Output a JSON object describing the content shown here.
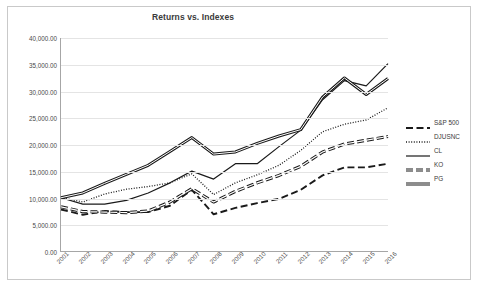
{
  "chart_data": {
    "type": "line",
    "title": "Returns vs. Indexes",
    "xlabel": "",
    "ylabel": "",
    "grid": true,
    "legend_position": "right",
    "ylim": [
      0,
      40000
    ],
    "ytick_labels": [
      "40,000.00",
      "35,000.00",
      "30,000.00",
      "25,000.00",
      "20,000.00",
      "15,000.00",
      "10,000.00",
      "5,000.00",
      "0.00"
    ],
    "ytick_values": [
      40000,
      35000,
      30000,
      25000,
      20000,
      15000,
      10000,
      5000,
      0
    ],
    "categories": [
      "2001",
      "2002",
      "2003",
      "2004",
      "2005",
      "2006",
      "2007",
      "2008",
      "2009",
      "2010",
      "2011",
      "2012",
      "2013",
      "2014",
      "2015",
      "2016"
    ],
    "series": [
      {
        "name": "S&P 500",
        "style": "long-dash",
        "values": [
          7800,
          6800,
          7500,
          7300,
          7300,
          8500,
          11500,
          6900,
          8100,
          9000,
          9800,
          11500,
          14200,
          15700,
          15700,
          16400
        ]
      },
      {
        "name": "DJUSNC",
        "style": "dotted",
        "values": [
          10000,
          9200,
          10700,
          11600,
          12100,
          12800,
          14500,
          10600,
          12800,
          14300,
          16100,
          18900,
          22400,
          23800,
          24600,
          26900
        ]
      },
      {
        "name": "CL",
        "style": "solid-thin",
        "values": [
          10000,
          8800,
          8800,
          9500,
          10900,
          12800,
          15000,
          13500,
          16400,
          16400,
          19600,
          22700,
          28400,
          32000,
          31000,
          35200
        ]
      },
      {
        "name": "KO",
        "style": "thick-dash",
        "values": [
          8300,
          7400,
          7300,
          7200,
          7500,
          9200,
          11700,
          9200,
          11200,
          12800,
          14200,
          15900,
          18600,
          20100,
          20800,
          21500
        ]
      },
      {
        "name": "PG",
        "style": "solid-thick",
        "values": [
          10000,
          10900,
          12700,
          14400,
          16100,
          18700,
          21300,
          18200,
          18600,
          20200,
          21600,
          22800,
          28900,
          32500,
          29400,
          32400
        ]
      }
    ]
  },
  "legend": {
    "items": [
      {
        "label": "S&P 500"
      },
      {
        "label": "DJUSNC"
      },
      {
        "label": "CL"
      },
      {
        "label": "KO"
      },
      {
        "label": "PG"
      }
    ]
  }
}
